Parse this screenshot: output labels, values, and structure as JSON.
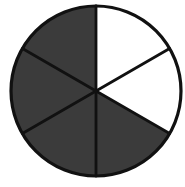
{
  "figure": {
    "name": "fraction-circle-diagram",
    "type": "pie",
    "title": "",
    "caption": "",
    "canvas": {
      "width": 185,
      "height": 187,
      "background": "#ffffff"
    }
  },
  "chart_data": {
    "type": "pie",
    "title": "",
    "subtitle": "",
    "xlabel": "",
    "ylabel": "",
    "legend": [],
    "legend_position": "none",
    "grid": false,
    "annotations": [],
    "geometry": {
      "center_x": 96,
      "center_y": 91,
      "radius": 85,
      "start_angle_deg": -90,
      "direction": "clockwise",
      "sector_count": 6,
      "sector_angle_deg": 60
    },
    "style": {
      "shaded_color": "#3b3b3b",
      "unshaded_color": "#ffffff",
      "outline_color": "#111111",
      "outline_width": 3.2,
      "spoke_width": 2.8
    },
    "fraction": {
      "numerator": 4,
      "denominator": 6,
      "shaded_count": 4,
      "unshaded_count": 2,
      "percent_shaded": 66.7,
      "label": "4/6"
    },
    "categories": [
      "sector-1",
      "sector-2",
      "sector-3",
      "sector-4",
      "sector-5",
      "sector-6"
    ],
    "values": [
      1,
      1,
      1,
      1,
      1,
      1
    ],
    "series": [
      {
        "name": "shaded",
        "values": [
          0,
          0,
          1,
          1,
          1,
          1
        ]
      }
    ],
    "sectors": [
      {
        "id": "sector-1",
        "index": 1,
        "position": "top-right",
        "start_deg": 0,
        "end_deg": 60,
        "shaded": false,
        "fill": "#ffffff"
      },
      {
        "id": "sector-2",
        "index": 2,
        "position": "right",
        "start_deg": 60,
        "end_deg": 120,
        "shaded": false,
        "fill": "#ffffff"
      },
      {
        "id": "sector-3",
        "index": 3,
        "position": "bottom-right",
        "start_deg": 120,
        "end_deg": 180,
        "shaded": true,
        "fill": "#3b3b3b"
      },
      {
        "id": "sector-4",
        "index": 4,
        "position": "bottom-left",
        "start_deg": 180,
        "end_deg": 240,
        "shaded": true,
        "fill": "#3b3b3b"
      },
      {
        "id": "sector-5",
        "index": 5,
        "position": "left",
        "start_deg": 240,
        "end_deg": 300,
        "shaded": true,
        "fill": "#3b3b3b"
      },
      {
        "id": "sector-6",
        "index": 6,
        "position": "top-left",
        "start_deg": 300,
        "end_deg": 360,
        "shaded": true,
        "fill": "#3b3b3b"
      }
    ],
    "spokes": [
      {
        "id": "spoke-0",
        "angle_deg": 0,
        "label": "12-oclock"
      },
      {
        "id": "spoke-1",
        "angle_deg": 60,
        "label": "2-oclock"
      },
      {
        "id": "spoke-2",
        "angle_deg": 120,
        "label": "4-oclock"
      },
      {
        "id": "spoke-3",
        "angle_deg": 180,
        "label": "6-oclock"
      },
      {
        "id": "spoke-4",
        "angle_deg": 240,
        "label": "8-oclock"
      },
      {
        "id": "spoke-5",
        "angle_deg": 300,
        "label": "10-oclock"
      }
    ]
  }
}
